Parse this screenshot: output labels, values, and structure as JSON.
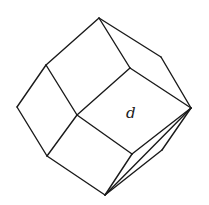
{
  "figure": {
    "stroke_color": "#1a1a1a",
    "background": "#ffffff",
    "vertices": {
      "top": [
        99,
        18
      ],
      "upper_left": [
        46,
        65
      ],
      "left": [
        17,
        107
      ],
      "lower_left": [
        47,
        156
      ],
      "bottom": [
        105,
        195
      ],
      "lower_inner_right": [
        132,
        154
      ],
      "right": [
        191,
        108
      ],
      "upper_outer_right": [
        161,
        57
      ],
      "upper_inner": [
        130,
        68
      ],
      "center": [
        77,
        115
      ],
      "lower_outer_right": [
        162,
        150
      ]
    },
    "edges": [
      [
        "top",
        "upper_left"
      ],
      [
        "upper_left",
        "left"
      ],
      [
        "left",
        "lower_left"
      ],
      [
        "lower_left",
        "bottom"
      ],
      [
        "bottom",
        "right"
      ],
      [
        "bottom",
        "lower_outer_right"
      ],
      [
        "lower_outer_right",
        "right"
      ],
      [
        "right",
        "upper_outer_right"
      ],
      [
        "upper_outer_right",
        "top"
      ],
      [
        "top",
        "upper_inner"
      ],
      [
        "upper_inner",
        "right"
      ],
      [
        "upper_inner",
        "center"
      ],
      [
        "upper_left",
        "center"
      ],
      [
        "center",
        "lower_left"
      ],
      [
        "center",
        "lower_inner_right"
      ],
      [
        "lower_inner_right",
        "right"
      ],
      [
        "lower_inner_right",
        "bottom"
      ]
    ],
    "label": {
      "text": "d",
      "x": 126,
      "y": 118
    }
  }
}
